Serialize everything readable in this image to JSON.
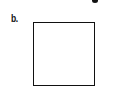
{
  "figure": {
    "panel_label": "b.",
    "shape": "square-outline",
    "colors": {
      "stroke": "#111111",
      "background": "#ffffff"
    }
  }
}
